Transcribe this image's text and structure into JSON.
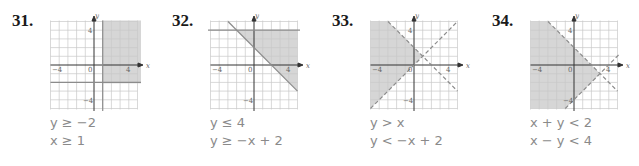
{
  "problems": [
    {
      "number": "31.",
      "inequalities": [
        "y ≥ −2",
        "x ≥ 1"
      ],
      "boundaries": [
        {
          "type": "horizontal",
          "y": -2,
          "style": "solid"
        },
        {
          "type": "vertical",
          "x": 1,
          "style": "solid"
        }
      ],
      "shaded_region": "x ≥ 1 and y ≥ −2"
    },
    {
      "number": "32.",
      "inequalities": [
        "y ≤ 4",
        "y ≥ −x + 2"
      ],
      "boundaries": [
        {
          "type": "horizontal",
          "y": 4,
          "style": "solid"
        },
        {
          "type": "line",
          "slope": -1,
          "intercept": 2,
          "style": "solid"
        }
      ],
      "shaded_region": "y ≤ 4 and y ≥ −x + 2"
    },
    {
      "number": "33.",
      "inequalities": [
        "y > x",
        "y < −x + 2"
      ],
      "boundaries": [
        {
          "type": "line",
          "slope": 1,
          "intercept": 0,
          "style": "dashed"
        },
        {
          "type": "line",
          "slope": -1,
          "intercept": 2,
          "style": "dashed"
        }
      ],
      "shaded_region": "y > x and y < −x + 2"
    },
    {
      "number": "34.",
      "inequalities": [
        "x + y < 2",
        "x − y < 4"
      ],
      "boundaries": [
        {
          "type": "line",
          "slope": -1,
          "intercept": 2,
          "style": "dashed"
        },
        {
          "type": "line",
          "slope": 1,
          "intercept": -4,
          "style": "dashed"
        }
      ],
      "shaded_region": "x + y < 2 and x − y < 4"
    }
  ],
  "axes": {
    "x_label": "x",
    "y_label": "y",
    "ticks": {
      "neg_x": "−4",
      "origin": "0",
      "pos_x": "4",
      "pos_y": "4",
      "neg_y": "−4"
    },
    "range": [
      -5,
      5
    ]
  },
  "colors": {
    "shade": "#d6d6d6",
    "grid": "#c8c8c8",
    "axis": "#333333",
    "boundary": "#8c8c8c",
    "text": "#8a8a8a"
  }
}
